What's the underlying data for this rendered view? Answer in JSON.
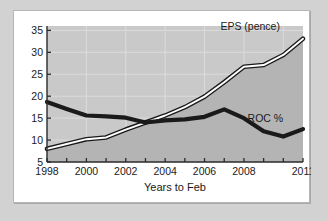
{
  "chart_data": {
    "type": "line",
    "title": "",
    "xlabel": "Years to Feb",
    "ylabel": "",
    "xlim": [
      1998,
      2011
    ],
    "ylim": [
      5,
      36
    ],
    "grid": true,
    "legend_position": "inline-annotation",
    "xticks": [
      1998,
      1999,
      2000,
      2001,
      2002,
      2003,
      2004,
      2005,
      2006,
      2007,
      2008,
      2009,
      2010,
      2011
    ],
    "xtick_labels": [
      "1998",
      "",
      "2000",
      "",
      "2002",
      "",
      "2004",
      "",
      "2006",
      "",
      "2008",
      "",
      "",
      "2011"
    ],
    "yticks": [
      5,
      10,
      15,
      20,
      25,
      30,
      35
    ],
    "ytick_labels": [
      "5",
      "10",
      "15",
      "20",
      "25",
      "30",
      "35"
    ],
    "x": [
      1998,
      1999,
      2000,
      2001,
      2002,
      2003,
      2004,
      2005,
      2006,
      2007,
      2008,
      2009,
      2010,
      2011
    ],
    "series": [
      {
        "name": "EPS (pence)",
        "label": "EPS (pence)",
        "style": "line-with-white-highlight-and-gray-fill",
        "color": "#1a1a1a",
        "highlight_color": "#ffffff",
        "fill_color": "#b4b4b4",
        "values": [
          8.0,
          9.1,
          10.2,
          10.6,
          12.4,
          14.0,
          15.6,
          17.5,
          19.9,
          23.2,
          26.7,
          27.1,
          29.4,
          33.1
        ]
      },
      {
        "name": "ROC %",
        "label": "ROC %",
        "style": "thick-black-line",
        "color": "#1a1a1a",
        "values": [
          18.7,
          17.1,
          15.6,
          15.4,
          15.1,
          14.0,
          14.5,
          14.7,
          15.3,
          17.0,
          15.0,
          12.0,
          10.8,
          12.5
        ]
      }
    ],
    "annotations": [
      {
        "text": "EPS (pence)",
        "x": 2008.0,
        "y": 35.0
      },
      {
        "text": "ROC %",
        "x": 2009.0,
        "y": 14.2
      }
    ]
  },
  "colors": {
    "page_background": "#d2d2d2",
    "card_background": "#ffffff",
    "plot_background": "#c9c9c9",
    "area_fill": "#b4b4b4",
    "gridline": "#dcdcdc",
    "axis": "#2b2b2b",
    "text": "#1a1a1a"
  }
}
